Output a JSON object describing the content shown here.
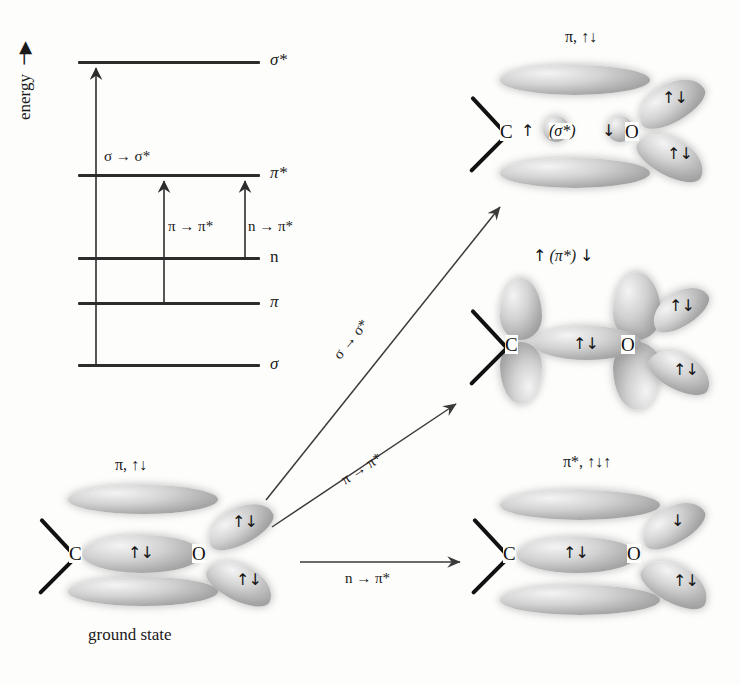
{
  "diagram": {
    "axis_label": "energy",
    "axis_arrow": "→"
  },
  "energy_diagram": {
    "levels": [
      {
        "key": "sigma_star",
        "label": "σ*",
        "y": 62
      },
      {
        "key": "pi_star",
        "label": "π*",
        "y": 175
      },
      {
        "key": "n",
        "label": "n",
        "y": 258
      },
      {
        "key": "pi",
        "label": "π",
        "y": 303
      },
      {
        "key": "sigma",
        "label": "σ",
        "y": 365
      }
    ],
    "transitions": [
      {
        "key": "s_ss",
        "label": "σ → σ*",
        "from": "sigma",
        "to": "sigma_star"
      },
      {
        "key": "p_ps",
        "label": "π → π*",
        "from": "pi",
        "to": "pi_star"
      },
      {
        "key": "n_ps",
        "label": "n → π*",
        "from": "n",
        "to": "pi_star"
      }
    ]
  },
  "process_arrows": [
    {
      "key": "sigma-to-sigma-star",
      "label": "σ → σ*"
    },
    {
      "key": "pi-to-pi-star",
      "label": "π → π*"
    },
    {
      "key": "n-to-pi-star",
      "label": "n → π*"
    }
  ],
  "states": {
    "ground": {
      "key": "ground-state",
      "top_label": "π, ↑↓",
      "caption": "ground state",
      "atom_left": "C",
      "atom_right": "O",
      "sigma_spin": "↑↓",
      "lone_pair_upper": "↑↓",
      "lone_pair_lower": "↑↓"
    },
    "sigma_excited": {
      "key": "sigma-sigma-star-state",
      "top_label": "π, ↑↓",
      "center_label_left": "↑",
      "center_label_orbital": "(σ*)",
      "center_label_right": "↓",
      "atom_left": "C",
      "atom_right": "O",
      "lone_pair_upper": "↑↓",
      "lone_pair_lower": "↑↓"
    },
    "pi_excited": {
      "key": "pi-pi-star-state",
      "top_label_left": "↑",
      "top_label_orbital": "(π*)",
      "top_label_right": "↓",
      "atom_left": "C",
      "atom_right": "O",
      "sigma_spin": "↑↓",
      "lone_pair_upper": "↑↓",
      "lone_pair_lower": "↑↓"
    },
    "n_excited": {
      "key": "n-pi-star-state",
      "top_label": "π*, ↑↓↑",
      "atom_left": "C",
      "atom_right": "O",
      "sigma_spin": "↑↓",
      "lone_pair_upper": "↓",
      "lone_pair_lower": "↑↓"
    }
  },
  "colors": {
    "ink": "#1a1a1a",
    "level": "#2c2c2c",
    "lobe_light": "#f4f4f4",
    "lobe_dark": "#8f8f8f",
    "background": "#fdfdfc"
  }
}
